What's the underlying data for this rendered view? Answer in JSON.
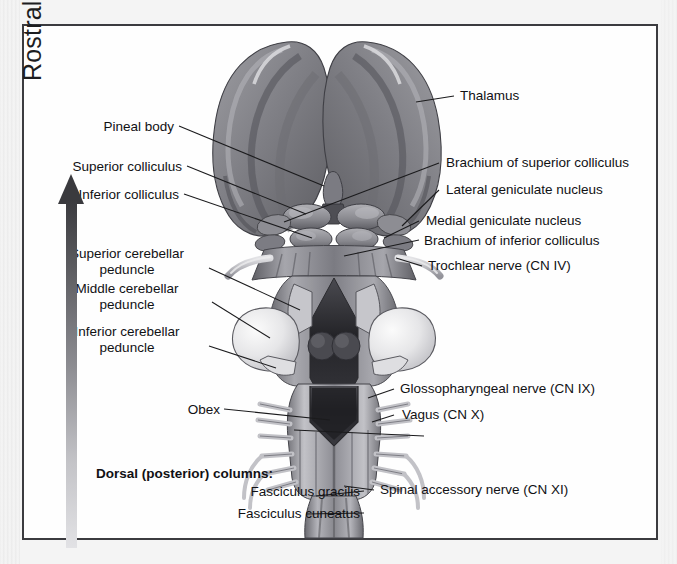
{
  "figure": {
    "orientation_arrow_label": "Rostral",
    "frame_color": "#3b3b3f",
    "background_color": "#fefefe",
    "ink_color": "#111114"
  },
  "labels_left": [
    {
      "id": "pineal-body",
      "text": "Pineal body"
    },
    {
      "id": "superior-colliculus",
      "text": "Superior colliculus"
    },
    {
      "id": "inferior-colliculus",
      "text": "Inferior colliculus"
    },
    {
      "id": "superior-cerebellar-peduncle",
      "line1": "Superior cerebellar",
      "line2": "peduncle"
    },
    {
      "id": "middle-cerebellar-peduncle",
      "line1": "Middle cerebellar",
      "line2": "peduncle"
    },
    {
      "id": "inferior-cerebellar-peduncle",
      "line1": "Inferior cerebellar",
      "line2": "peduncle"
    },
    {
      "id": "obex",
      "text": "Obex"
    },
    {
      "id": "dorsal-columns-header",
      "text": "Dorsal (posterior) columns:",
      "bold": true
    },
    {
      "id": "fasciculus-gracilis",
      "text": "Fasciculus gracilis"
    },
    {
      "id": "fasciculus-cuneatus",
      "text": "Fasciculus cuneatus"
    }
  ],
  "labels_right": [
    {
      "id": "thalamus",
      "text": "Thalamus"
    },
    {
      "id": "brachium-superior-colliculus",
      "text": "Brachium of superior colliculus"
    },
    {
      "id": "lateral-geniculate-nucleus",
      "text": "Lateral geniculate nucleus"
    },
    {
      "id": "medial-geniculate-nucleus",
      "text": "Medial geniculate nucleus"
    },
    {
      "id": "brachium-inferior-colliculus",
      "text": "Brachium of inferior colliculus"
    },
    {
      "id": "trochlear-nerve",
      "text": "Trochlear nerve (CN IV)"
    },
    {
      "id": "glossopharyngeal-nerve",
      "text": "Glossopharyngeal nerve (CN IX)"
    },
    {
      "id": "vagus-nerve",
      "text": "Vagus (CN X)"
    },
    {
      "id": "spinal-accessory-nerve",
      "text": "Spinal accessory nerve (CN XI)"
    }
  ],
  "palette": {
    "thalamus_dark": "#6e6e72",
    "thalamus_mid": "#8a8a8f",
    "thalamus_light": "#a8a8ad",
    "peduncle_light": "#e9e9ea",
    "ventricle_dark": "#2a2a2e",
    "cord_mid": "#9a9a9f",
    "rootlet": "#c9c9cc",
    "arrow_top": "#3a3a3e",
    "arrow_bottom": "#e2e2e5"
  }
}
